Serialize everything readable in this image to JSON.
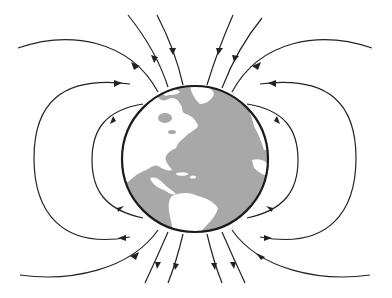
{
  "diagram": {
    "title": "Earth's magnetic field lines",
    "colors": {
      "background": "#ffffff",
      "ocean": "#a8a8a8",
      "land": "#ffffff",
      "outline": "#1a1a1a",
      "field_line": "#222222"
    },
    "globe": {
      "cx": 195,
      "cy": 159,
      "r": 73,
      "visible_region": "Americas and Atlantic Ocean"
    },
    "field_lines": [
      {
        "id": "top-left-outer",
        "direction": "inward"
      },
      {
        "id": "top-left-mid",
        "direction": "inward"
      },
      {
        "id": "top-left-inner",
        "direction": "inward"
      },
      {
        "id": "top-right-inner",
        "direction": "inward"
      },
      {
        "id": "top-right-mid",
        "direction": "inward"
      },
      {
        "id": "top-right-outer",
        "direction": "inward"
      },
      {
        "id": "left-loop-outer",
        "direction": "south-to-north"
      },
      {
        "id": "left-loop-inner",
        "direction": "south-to-north"
      },
      {
        "id": "right-loop-outer",
        "direction": "south-to-north"
      },
      {
        "id": "right-loop-inner",
        "direction": "south-to-north"
      },
      {
        "id": "bottom-left-outer",
        "direction": "outward"
      },
      {
        "id": "bottom-left-mid",
        "direction": "outward"
      },
      {
        "id": "bottom-left-inner",
        "direction": "outward"
      },
      {
        "id": "bottom-right-inner",
        "direction": "outward"
      },
      {
        "id": "bottom-right-mid",
        "direction": "outward"
      },
      {
        "id": "bottom-right-outer",
        "direction": "outward"
      }
    ]
  }
}
